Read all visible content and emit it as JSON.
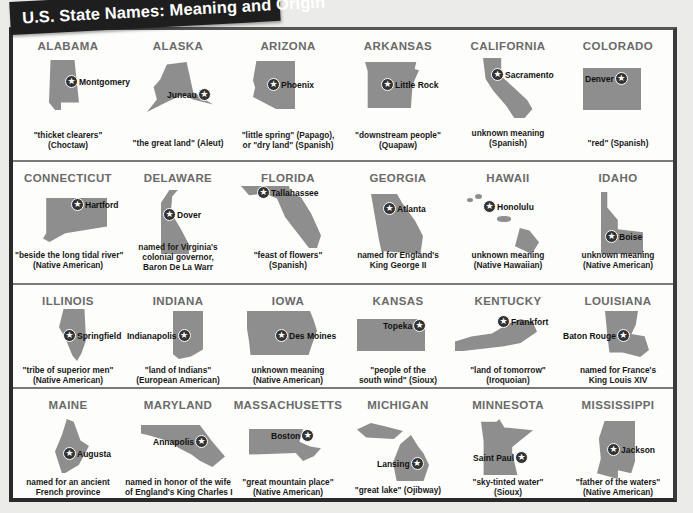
{
  "title": "U.S. State Names: Meaning and Origin",
  "colors": {
    "banner": "#1e1e1e",
    "map": "#8e8e8e",
    "state_name": "#6a6a6a",
    "divider": "#7a7a7a"
  },
  "rows": [
    {
      "states": [
        {
          "name": "ALABAMA",
          "capital": "Montgomery",
          "meaning": [
            "\"thicket clearers\"",
            "(Choctaw)"
          ]
        },
        {
          "name": "ALASKA",
          "capital": "Juneau",
          "meaning": [
            "\"the great land\" (Aleut)"
          ]
        },
        {
          "name": "ARIZONA",
          "capital": "Phoenix",
          "meaning": [
            "\"little spring\" (Papago),",
            "or \"dry land\" (Spanish)"
          ]
        },
        {
          "name": "ARKANSAS",
          "capital": "Little Rock",
          "meaning": [
            "\"downstream people\"",
            "(Quapaw)"
          ]
        },
        {
          "name": "CALIFORNIA",
          "capital": "Sacramento",
          "meaning": [
            "unknown meaning",
            "(Spanish)"
          ]
        },
        {
          "name": "COLORADO",
          "capital": "Denver",
          "meaning": [
            "\"red\" (Spanish)"
          ]
        }
      ]
    },
    {
      "states": [
        {
          "name": "CONNECTICUT",
          "capital": "Hartford",
          "meaning": [
            "\"beside the long tidal river\"",
            "(Native American)"
          ]
        },
        {
          "name": "DELAWARE",
          "capital": "Dover",
          "meaning": [
            "named for Virginia's",
            "colonial governor,",
            "Baron De La Warr"
          ]
        },
        {
          "name": "FLORIDA",
          "capital": "Tallahassee",
          "meaning": [
            "\"feast of flowers\"",
            "(Spanish)"
          ]
        },
        {
          "name": "GEORGIA",
          "capital": "Atlanta",
          "meaning": [
            "named for England's",
            "King George II"
          ]
        },
        {
          "name": "HAWAII",
          "capital": "Honolulu",
          "meaning": [
            "unknown meaning",
            "(Native Hawaiian)"
          ]
        },
        {
          "name": "IDAHO",
          "capital": "Boise",
          "meaning": [
            "unknown meaning",
            "(Native American)"
          ]
        }
      ]
    },
    {
      "states": [
        {
          "name": "ILLINOIS",
          "capital": "Springfield",
          "meaning": [
            "\"tribe of superior men\"",
            "(Native American)"
          ]
        },
        {
          "name": "INDIANA",
          "capital": "Indianapolis",
          "meaning": [
            "\"land of Indians\"",
            "(European American)"
          ]
        },
        {
          "name": "IOWA",
          "capital": "Des Moines",
          "meaning": [
            "unknown meaning",
            "(Native American)"
          ]
        },
        {
          "name": "KANSAS",
          "capital": "Topeka",
          "meaning": [
            "\"people of the",
            "south wind\" (Sioux)"
          ]
        },
        {
          "name": "KENTUCKY",
          "capital": "Frankfort",
          "meaning": [
            "\"land of tomorrow\"",
            "(Iroquoian)"
          ]
        },
        {
          "name": "LOUISIANA",
          "capital": "Baton Rouge",
          "meaning": [
            "named for France's",
            "King Louis XIV"
          ]
        }
      ]
    },
    {
      "states": [
        {
          "name": "MAINE",
          "capital": "Augusta",
          "meaning": [
            "named for an ancient",
            "French province"
          ]
        },
        {
          "name": "MARYLAND",
          "capital": "Annapolis",
          "meaning": [
            "named in honor of the wife",
            "of England's King Charles I"
          ]
        },
        {
          "name": "MASSACHUSETTS",
          "capital": "Boston",
          "meaning": [
            "\"great mountain place\"",
            "(Native American)"
          ]
        },
        {
          "name": "MICHIGAN",
          "capital": "Lansing",
          "meaning": [
            "\"great lake\" (Ojibway)"
          ]
        },
        {
          "name": "MINNESOTA",
          "capital": "Saint Paul",
          "meaning": [
            "\"sky-tinted water\"",
            "(Sioux)"
          ]
        },
        {
          "name": "MISSISSIPPI",
          "capital": "Jackson",
          "meaning": [
            "\"father of the waters\"",
            "(Native American)"
          ]
        }
      ]
    }
  ]
}
